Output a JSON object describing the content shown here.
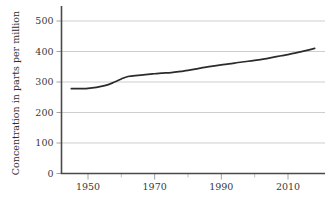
{
  "chart_data": {
    "type": "line",
    "title": "",
    "xlabel": "",
    "ylabel": "Concentration in parts per million",
    "xlim": [
      1945,
      2018
    ],
    "ylim": [
      0,
      520
    ],
    "grid": true,
    "legend": false,
    "y_ticks": [
      0,
      100,
      200,
      300,
      400,
      500
    ],
    "y_tick_labels": [
      "0",
      "100",
      "200",
      "300",
      "400",
      "500"
    ],
    "x_ticks": [
      1950,
      1970,
      1990,
      2010
    ],
    "x_tick_labels": [
      "1950",
      "1970",
      "1990",
      "2010"
    ],
    "x_minor_ticks": [
      1960,
      1980,
      2000
    ],
    "series": [
      {
        "name": "Concentration",
        "x": [
          1945,
          1950,
          1955,
          1958,
          1960,
          1962,
          1965,
          1968,
          1970,
          1972,
          1975,
          1978,
          1980,
          1983,
          1985,
          1988,
          1990,
          1993,
          1995,
          1998,
          2000,
          2003,
          2005,
          2008,
          2010,
          2013,
          2015,
          2018
        ],
        "values": [
          278,
          279,
          288,
          300,
          310,
          318,
          322,
          325,
          327,
          329,
          331,
          335,
          338,
          344,
          348,
          353,
          356,
          360,
          364,
          368,
          371,
          376,
          380,
          386,
          390,
          397,
          402,
          410
        ]
      }
    ],
    "colors": {
      "line": "#2b2b2b",
      "grid": "#b9b9b9",
      "axis": "#4a4a4a",
      "text": "#3a3a3a",
      "background": "#ffffff"
    }
  }
}
